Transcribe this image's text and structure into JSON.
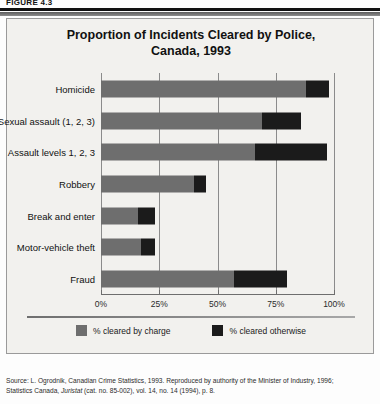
{
  "figure": {
    "label": "FIGURE 4.3"
  },
  "chart_title": {
    "line1": "Proportion of Incidents Cleared by Police,",
    "line2": "Canada, 1993"
  },
  "legend": {
    "items": [
      {
        "key": "charge",
        "label": "% cleared by charge",
        "color": "#6e6e6e"
      },
      {
        "key": "other",
        "label": "% cleared otherwise",
        "color": "#1b1b1b"
      }
    ]
  },
  "axis": {
    "ticks": [
      {
        "label": "0%",
        "value": 0
      },
      {
        "label": "25%",
        "value": 25
      },
      {
        "label": "50%",
        "value": 50
      },
      {
        "label": "75%",
        "value": 75
      },
      {
        "label": "100%",
        "value": 100
      }
    ]
  },
  "source": {
    "line1": "Source: L. Ogrodnik, Canadian Crime Statistics, 1993. Reproduced by authority of the Minister of Industry, 1996;",
    "line2_pre": "Statistics Canada, ",
    "line2_italic": "Juristat",
    "line2_post": " (cat. no. 85-002), vol. 14, no. 14 (1994), p. 8."
  },
  "chart_data": {
    "type": "bar",
    "orientation": "horizontal",
    "stacked": true,
    "title": "Proportion of Incidents Cleared by Police, Canada, 1993",
    "xlabel": "",
    "ylabel": "",
    "xlim": [
      0,
      100
    ],
    "grid": true,
    "legend_position": "bottom",
    "categories": [
      "Homicide",
      "Sexual assault (1, 2, 3)",
      "Assault levels 1, 2, 3",
      "Robbery",
      "Break and enter",
      "Motor-vehicle theft",
      "Fraud"
    ],
    "series": [
      {
        "name": "% cleared by charge",
        "color": "#6e6e6e",
        "values": [
          88,
          69,
          66,
          40,
          16,
          17,
          57
        ]
      },
      {
        "name": "% cleared otherwise",
        "color": "#1b1b1b",
        "values": [
          10,
          17,
          31,
          5,
          7,
          6,
          23
        ]
      }
    ],
    "totals": [
      98,
      86,
      97,
      45,
      23,
      23,
      80
    ],
    "xticks": [
      0,
      25,
      50,
      75,
      100
    ],
    "xticklabels": [
      "0%",
      "25%",
      "50%",
      "75%",
      "100%"
    ]
  }
}
